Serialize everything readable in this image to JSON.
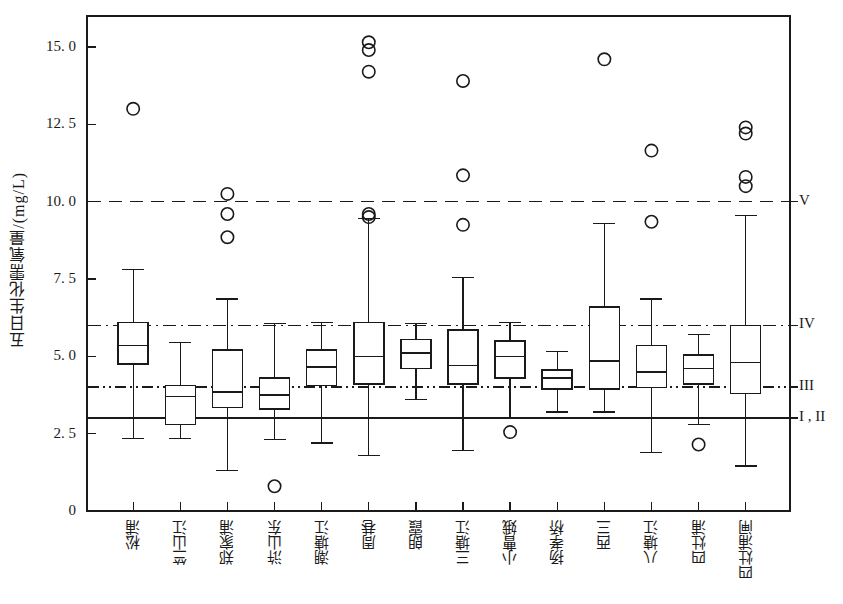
{
  "chart_data": {
    "type": "box",
    "title": "",
    "xlabel": "",
    "ylabel": "五日生化需氧量/(mg/L)",
    "ylim": [
      0,
      16.0
    ],
    "yticks": [
      0,
      2.5,
      5.0,
      7.5,
      10.0,
      12.5,
      15.0
    ],
    "ytick_labels": [
      "0",
      "2. 5",
      "5. 0",
      "7. 5",
      "10. 0",
      "12. 5",
      "15. 0"
    ],
    "grid": false,
    "legend_position": "right-inside",
    "categories": [
      "松浦",
      "竺山江",
      "郑家浦",
      "浒山东",
      "潮塘江",
      "周巷",
      "朗霞",
      "三塘江",
      "小曹娥",
      "扬孝桥",
      "西三",
      "八塘江",
      "四灶浦",
      "四灶浦闸"
    ],
    "reference_lines": [
      {
        "label": "V",
        "value": 10.0,
        "style": "dashed"
      },
      {
        "label": "IV",
        "value": 6.0,
        "style": "dashdot"
      },
      {
        "label": "III",
        "value": 4.0,
        "style": "dashdotdot"
      },
      {
        "label": "I , II",
        "value": 3.0,
        "style": "solid"
      }
    ],
    "boxes": [
      {
        "category": "松浦",
        "whisker_low": 2.35,
        "q1": 4.75,
        "median": 5.35,
        "q3": 6.1,
        "whisker_high": 7.8,
        "outliers": [
          13.0
        ]
      },
      {
        "category": "竺山江",
        "whisker_low": 2.35,
        "q1": 2.8,
        "median": 3.7,
        "q3": 4.05,
        "whisker_high": 5.45,
        "outliers": []
      },
      {
        "category": "郑家浦",
        "whisker_low": 1.3,
        "q1": 3.35,
        "median": 3.85,
        "q3": 5.2,
        "whisker_high": 6.85,
        "outliers": [
          10.25,
          9.6,
          8.85
        ]
      },
      {
        "category": "浒山东",
        "whisker_low": 2.3,
        "q1": 3.3,
        "median": 3.75,
        "q3": 4.3,
        "whisker_high": 6.05,
        "outliers": [
          0.8
        ]
      },
      {
        "category": "潮塘江",
        "whisker_low": 2.2,
        "q1": 4.05,
        "median": 4.65,
        "q3": 5.2,
        "whisker_high": 6.1,
        "outliers": []
      },
      {
        "category": "周巷",
        "whisker_low": 1.8,
        "q1": 4.1,
        "median": 5.0,
        "q3": 6.1,
        "whisker_high": 9.45,
        "outliers": [
          15.15,
          14.9,
          14.2,
          9.6,
          9.5
        ]
      },
      {
        "category": "朗霞",
        "whisker_low": 3.6,
        "q1": 4.6,
        "median": 5.1,
        "q3": 5.55,
        "whisker_high": 6.05,
        "outliers": []
      },
      {
        "category": "三塘江",
        "whisker_low": 1.95,
        "q1": 4.1,
        "median": 4.7,
        "q3": 5.85,
        "whisker_high": 7.55,
        "outliers": [
          13.9,
          10.85,
          9.25
        ]
      },
      {
        "category": "小曹娥",
        "whisker_low": 3.0,
        "q1": 4.3,
        "median": 5.0,
        "q3": 5.5,
        "whisker_high": 6.1,
        "outliers": [
          2.55
        ]
      },
      {
        "category": "扬孝桥",
        "whisker_low": 3.2,
        "q1": 3.95,
        "median": 4.3,
        "q3": 4.55,
        "whisker_high": 5.15,
        "outliers": []
      },
      {
        "category": "西三",
        "whisker_low": 3.2,
        "q1": 3.95,
        "median": 4.85,
        "q3": 6.6,
        "whisker_high": 9.3,
        "outliers": [
          14.6
        ]
      },
      {
        "category": "八塘江",
        "whisker_low": 1.9,
        "q1": 4.0,
        "median": 4.5,
        "q3": 5.35,
        "whisker_high": 6.85,
        "outliers": [
          11.65,
          9.35
        ]
      },
      {
        "category": "四灶浦",
        "whisker_low": 2.8,
        "q1": 4.1,
        "median": 4.6,
        "q3": 5.05,
        "whisker_high": 5.7,
        "outliers": [
          2.15
        ]
      },
      {
        "category": "四灶浦闸",
        "whisker_low": 1.45,
        "q1": 3.8,
        "median": 4.8,
        "q3": 6.0,
        "whisker_high": 9.55,
        "outliers": [
          12.4,
          12.2,
          10.8,
          10.5
        ]
      }
    ],
    "colors": {
      "line": "#1a1a1a",
      "box_fill": "#ffffff",
      "frame": "#1a1a1a"
    }
  }
}
